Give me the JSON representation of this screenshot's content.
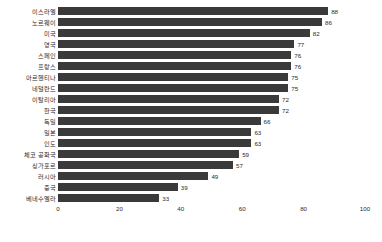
{
  "chart_data": {
    "type": "bar",
    "orientation": "horizontal",
    "title": "",
    "subtitle": "",
    "xlabel": "",
    "ylabel": "",
    "xlim": [
      0,
      100
    ],
    "xticks": [
      0,
      20,
      40,
      60,
      80,
      100
    ],
    "xtick_labels": [
      "0",
      "20",
      "40",
      "60",
      "80",
      "100"
    ],
    "grid": false,
    "legend": null,
    "bar_color": "#3a3a3a",
    "text_color": "#2b2b2b",
    "background_color": "#ffffff",
    "categories": [
      "이스라엘",
      "노르웨이",
      "미국",
      "영국",
      "스페인",
      "프랑스",
      "아르헨티나",
      "네덜란드",
      "이탈리아",
      "한국",
      "독일",
      "일본",
      "인도",
      "체코 공화국",
      "싱가포르",
      "러시아",
      "중국",
      "베네수엘라"
    ],
    "values": [
      88,
      86,
      82,
      77,
      76,
      76,
      75,
      75,
      72,
      72,
      66,
      63,
      63,
      59,
      57,
      49,
      39,
      33
    ],
    "data_labels": [
      "88",
      "86",
      "82",
      "77",
      "76",
      "76",
      "75",
      "75",
      "72",
      "72",
      "66",
      "63",
      "63",
      "59",
      "57",
      "49",
      "39",
      "33"
    ],
    "points": [
      {
        "category": "이스라엘",
        "value": 88,
        "label": "88"
      },
      {
        "category": "노르웨이",
        "value": 86,
        "label": "86"
      },
      {
        "category": "미국",
        "value": 82,
        "label": "82"
      },
      {
        "category": "영국",
        "value": 77,
        "label": "77"
      },
      {
        "category": "스페인",
        "value": 76,
        "label": "76"
      },
      {
        "category": "프랑스",
        "value": 76,
        "label": "76"
      },
      {
        "category": "아르헨티나",
        "value": 75,
        "label": "75"
      },
      {
        "category": "네덜란드",
        "value": 75,
        "label": "75"
      },
      {
        "category": "이탈리아",
        "value": 72,
        "label": "72"
      },
      {
        "category": "한국",
        "value": 72,
        "label": "72"
      },
      {
        "category": "독일",
        "value": 66,
        "label": "66"
      },
      {
        "category": "일본",
        "value": 63,
        "label": "63"
      },
      {
        "category": "인도",
        "value": 63,
        "label": "63"
      },
      {
        "category": "체코 공화국",
        "value": 59,
        "label": "59"
      },
      {
        "category": "싱가포르",
        "value": 57,
        "label": "57"
      },
      {
        "category": "러시아",
        "value": 49,
        "label": "49"
      },
      {
        "category": "중국",
        "value": 39,
        "label": "39"
      },
      {
        "category": "베네수엘라",
        "value": 33,
        "label": "33"
      }
    ]
  }
}
